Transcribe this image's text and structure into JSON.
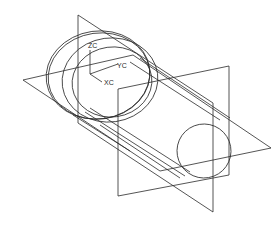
{
  "drawing": {
    "type": "CAD wireframe isometric view",
    "subject": "stepped cylindrical shaft with datum planes",
    "line_color": "#2a2a2a",
    "background": "#ffffff",
    "axes": {
      "z_label": "ZC",
      "y_label": "YC",
      "x_label": "XC"
    }
  }
}
